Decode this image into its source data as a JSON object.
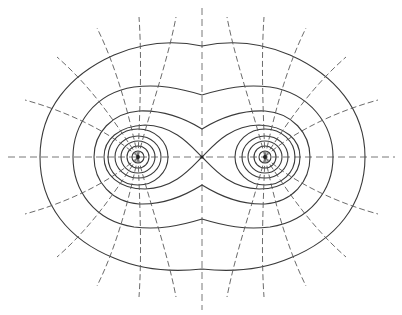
{
  "diagram": {
    "title": "",
    "colors": {
      "background": "#ffffff",
      "equipotential": "#3a3a3a",
      "field_line": "#5a5a5a",
      "axis": "#6a6a6a"
    },
    "charges": [
      {
        "id": "left",
        "x": 138,
        "y": 157
      },
      {
        "id": "right",
        "x": 265,
        "y": 157
      }
    ],
    "saddle_point": {
      "x": 202,
      "y": 157
    },
    "axes": {
      "horizontal": {
        "x1": 8,
        "x2": 395,
        "y": 157
      },
      "vertical": {
        "x": 202,
        "y1": 8,
        "y2": 310
      }
    },
    "labels": []
  }
}
